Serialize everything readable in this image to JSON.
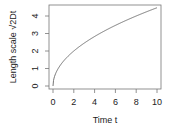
{
  "chart_data": {
    "type": "line",
    "title": "",
    "xlabel": "Time t",
    "ylabel": "Length scale √2Dt",
    "xlim": [
      0,
      10
    ],
    "ylim": [
      0,
      4.5
    ],
    "xticks": [
      "0",
      "2",
      "4",
      "6",
      "8",
      "10"
    ],
    "yticks": [
      "0",
      "1",
      "2",
      "3",
      "4"
    ],
    "grid": false,
    "legend": null,
    "series": [
      {
        "name": "sqrt(2t)",
        "x": [
          0,
          0.1,
          0.25,
          0.5,
          1,
          2,
          3,
          4,
          5,
          6,
          7,
          8,
          9,
          10
        ],
        "values": [
          0,
          0.45,
          0.71,
          1.0,
          1.41,
          2.0,
          2.45,
          2.83,
          3.16,
          3.46,
          3.74,
          4.0,
          4.24,
          4.47
        ]
      }
    ]
  }
}
